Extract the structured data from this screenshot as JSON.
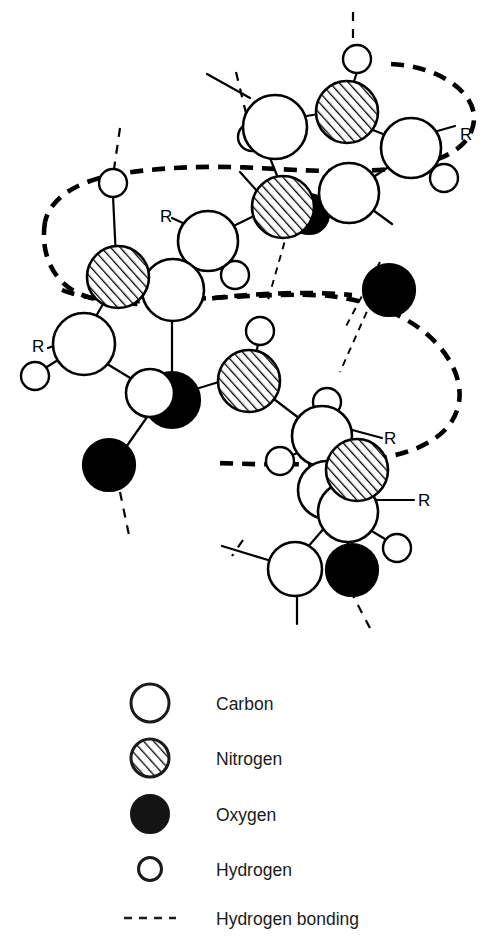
{
  "figure": {
    "colors": {
      "ink": "#000000",
      "paper": "#ffffff",
      "legend_ink": "#1a1a1a"
    },
    "side_chain_labels": [
      {
        "id": "r-top-right",
        "text": "R",
        "x": 460,
        "y": 140
      },
      {
        "id": "r-mid-left-upper",
        "text": "R",
        "x": 160,
        "y": 222
      },
      {
        "id": "r-mid-left-lower",
        "text": "R",
        "x": 38,
        "y": 348
      },
      {
        "id": "r-bottom-right-upper",
        "text": "R",
        "x": 386,
        "y": 444
      },
      {
        "id": "r-bottom-right-lower",
        "text": "R",
        "x": 420,
        "y": 505
      }
    ],
    "atom_counts": {
      "carbon": 13,
      "nitrogen": 5,
      "oxygen": 5,
      "hydrogen": 11
    }
  },
  "legend": {
    "items": [
      {
        "symbol": "large-open-circle",
        "icon": "carbon-atom-icon",
        "label": "Carbon"
      },
      {
        "symbol": "large-hatched-circle",
        "icon": "nitrogen-atom-icon",
        "label": "Nitrogen"
      },
      {
        "symbol": "large-filled-circle",
        "icon": "oxygen-atom-icon",
        "label": "Oxygen"
      },
      {
        "symbol": "small-open-circle",
        "icon": "hydrogen-atom-icon",
        "label": "Hydrogen"
      },
      {
        "symbol": "dashed-line",
        "icon": "hydrogen-bond-icon",
        "label": "Hydrogen bonding"
      }
    ]
  }
}
